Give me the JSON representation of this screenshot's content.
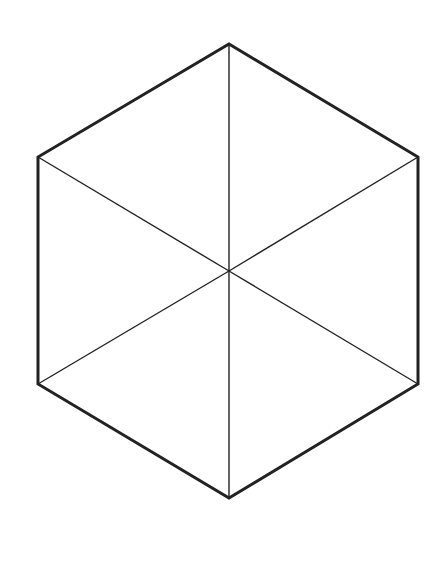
{
  "diagram": {
    "type": "hexagon-divided-into-triangles",
    "background": "#ffffff",
    "stroke_color": "#222222",
    "outline_width": 3,
    "spoke_width": 1.4,
    "vertices": {
      "top": [
        229,
        44
      ],
      "upper_right": [
        418,
        157
      ],
      "lower_right": [
        418,
        384
      ],
      "bottom": [
        229,
        498
      ],
      "lower_left": [
        38,
        384
      ],
      "upper_left": [
        38,
        157
      ]
    },
    "center": [
      229,
      271
    ],
    "spokes": [
      "top",
      "upper_right",
      "lower_right",
      "bottom",
      "lower_left",
      "upper_left"
    ]
  }
}
